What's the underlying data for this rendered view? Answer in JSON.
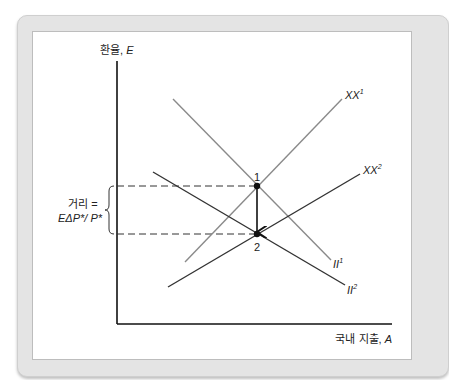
{
  "diagram": {
    "y_axis_label": {
      "prefix": "환율, ",
      "var": "E"
    },
    "x_axis_label": {
      "prefix": "국내 지출, ",
      "var": "A"
    },
    "curves": [
      {
        "id": "XX1",
        "label": "XX",
        "sup": "1",
        "color": "#8a8a8a",
        "from": [
          185,
          262
        ],
        "to": [
          342,
          99
        ]
      },
      {
        "id": "XX2",
        "label": "XX",
        "sup": "2",
        "color": "#333333",
        "from": [
          168,
          287
        ],
        "to": [
          360,
          174
        ]
      },
      {
        "id": "II1",
        "label": "II",
        "sup": "1",
        "color": "#8a8a8a",
        "from": [
          173,
          99
        ],
        "to": [
          331,
          260
        ]
      },
      {
        "id": "II2",
        "label": "II",
        "sup": "2",
        "color": "#333333",
        "from": [
          153,
          172
        ],
        "to": [
          345,
          285
        ]
      }
    ],
    "points": [
      {
        "label": "1",
        "x": 257,
        "y": 186
      },
      {
        "label": "2",
        "x": 257,
        "y": 234
      }
    ],
    "distance_label": {
      "line1": "거리 =",
      "line2": "EΔP*/ P*"
    },
    "colors": {
      "frame": "#e4e4e4",
      "panel": "#ffffff",
      "axis": "#111111",
      "light_curve": "#8a8a8a",
      "dark_curve": "#333333"
    }
  }
}
